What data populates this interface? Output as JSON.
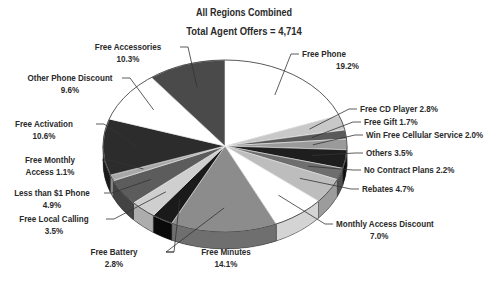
{
  "chart_data": {
    "type": "pie",
    "style": "3d-exploded-tilted",
    "title": "All Regions Combined",
    "subtitle": "Total Agent Offers = 4,714",
    "total": 4714,
    "unit": "%",
    "start_angle_deg": 0,
    "direction": "clockwise",
    "slices": [
      {
        "label": "Free Phone",
        "value": 19.2,
        "color": "#ffffff",
        "side": "#e6e6e6",
        "label_lines": [
          "Free Phone",
          "19.2%"
        ],
        "lx": 302,
        "ly": 57,
        "anchor": "start"
      },
      {
        "label": "Free CD Player",
        "value": 2.8,
        "color": "#c8c8c8",
        "side": "#a8a8a8",
        "label_lines": [
          "Free CD Player 2.8%"
        ],
        "lx": 360,
        "ly": 112,
        "anchor": "start"
      },
      {
        "label": "Free Gift",
        "value": 1.7,
        "color": "#5a5a5a",
        "side": "#404040",
        "label_lines": [
          "Free Gift 1.7%"
        ],
        "lx": 364,
        "ly": 125,
        "anchor": "start"
      },
      {
        "label": "Win Free Cellular Service",
        "value": 2.0,
        "color": "#9a9a9a",
        "side": "#7a7a7a",
        "label_lines": [
          "Win Free Cellular Service 2.0%"
        ],
        "lx": 366,
        "ly": 138,
        "anchor": "start"
      },
      {
        "label": "Others",
        "value": 3.5,
        "color": "#1e1e1e",
        "side": "#0e0e0e",
        "label_lines": [
          "Others 3.5%"
        ],
        "lx": 366,
        "ly": 156,
        "anchor": "start"
      },
      {
        "label": "No Contract Plans",
        "value": 2.2,
        "color": "#6e6e6e",
        "side": "#505050",
        "label_lines": [
          "No Contract Plans 2.2%"
        ],
        "lx": 364,
        "ly": 173,
        "anchor": "start"
      },
      {
        "label": "Rebates",
        "value": 4.7,
        "color": "#bdbdbd",
        "side": "#9c9c9c",
        "label_lines": [
          "Rebates 4.7%"
        ],
        "lx": 362,
        "ly": 192,
        "anchor": "start"
      },
      {
        "label": "Monthly Access Discount",
        "value": 7.0,
        "color": "#ffffff",
        "side": "#d4d4d4",
        "label_lines": [
          "Monthly Access Discount",
          "7.0%"
        ],
        "lx": 336,
        "ly": 227,
        "anchor": "start"
      },
      {
        "label": "Free Minutes",
        "value": 14.1,
        "color": "#8c8c8c",
        "side": "#6f6f6f",
        "label_lines": [
          "Free Minutes",
          "14.1%"
        ],
        "lx": 226,
        "ly": 255,
        "anchor": "middle"
      },
      {
        "label": "Free Battery",
        "value": 2.8,
        "color": "#1a1a1a",
        "side": "#0a0a0a",
        "label_lines": [
          "Free Battery",
          "2.8%"
        ],
        "lx": 114,
        "ly": 255,
        "anchor": "middle"
      },
      {
        "label": "Free Local Calling",
        "value": 3.5,
        "color": "#cfcfcf",
        "side": "#adadad",
        "label_lines": [
          "Free Local Calling",
          "3.5%"
        ],
        "lx": 54,
        "ly": 222,
        "anchor": "middle"
      },
      {
        "label": "Less than $1 Phone",
        "value": 4.9,
        "color": "#5c5c5c",
        "side": "#434343",
        "label_lines": [
          "Less than $1 Phone",
          "4.9%"
        ],
        "lx": 52,
        "ly": 196,
        "anchor": "middle"
      },
      {
        "label": "Free Monthly Access",
        "value": 1.1,
        "color": "#a8a8a8",
        "side": "#888888",
        "label_lines": [
          "Free Monthly",
          "Access 1.1%"
        ],
        "lx": 50,
        "ly": 163,
        "anchor": "middle"
      },
      {
        "label": "Free Activation",
        "value": 10.6,
        "color": "#2c2c2c",
        "side": "#1a1a1a",
        "label_lines": [
          "Free Activation",
          "10.6%"
        ],
        "lx": 44,
        "ly": 127,
        "anchor": "middle"
      },
      {
        "label": "Other Phone Discount",
        "value": 9.6,
        "color": "#ffffff",
        "side": "#e0e0e0",
        "label_lines": [
          "Other Phone Discount",
          "9.6%"
        ],
        "lx": 70,
        "ly": 81,
        "anchor": "middle"
      },
      {
        "label": "Free Accessories",
        "value": 10.3,
        "color": "#4a4a4a",
        "side": "#333333",
        "label_lines": [
          "Free Accessories",
          "10.3%"
        ],
        "lx": 128,
        "ly": 50,
        "anchor": "middle"
      }
    ]
  }
}
